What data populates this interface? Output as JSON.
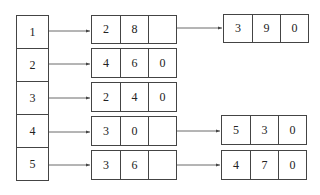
{
  "diagram": {
    "type": "adjacency-list",
    "index_column": [
      "1",
      "2",
      "3",
      "4",
      "5"
    ],
    "lists": [
      {
        "head": "1",
        "nodes": [
          [
            "2",
            "8",
            ""
          ],
          [
            "3",
            "9",
            "0"
          ]
        ]
      },
      {
        "head": "2",
        "nodes": [
          [
            "4",
            "6",
            "0"
          ]
        ]
      },
      {
        "head": "3",
        "nodes": [
          [
            "2",
            "4",
            "0"
          ]
        ]
      },
      {
        "head": "4",
        "nodes": [
          [
            "3",
            "0",
            ""
          ],
          [
            "5",
            "3",
            "0"
          ]
        ]
      },
      {
        "head": "5",
        "nodes": [
          [
            "3",
            "6",
            ""
          ],
          [
            "4",
            "7",
            "0"
          ]
        ]
      }
    ],
    "colors": {
      "line": "#444444",
      "text": "#222222",
      "background": "#ffffff"
    }
  }
}
